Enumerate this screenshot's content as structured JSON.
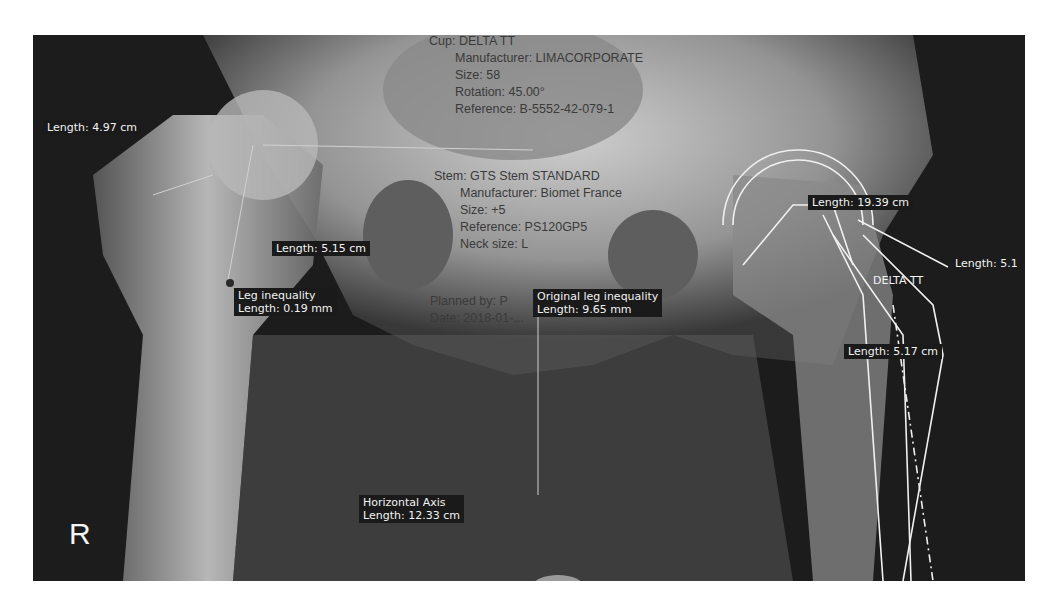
{
  "image": {
    "side_marker": "R"
  },
  "implants": {
    "cup": {
      "title": "Cup: DELTA TT",
      "manufacturer": "Manufacturer: LIMACORPORATE",
      "size": "Size: 58",
      "rotation": "Rotation: 45.00°",
      "reference": "Reference: B-5552-42-079-1"
    },
    "stem": {
      "title": "Stem: GTS Stem STANDARD",
      "manufacturer": "Manufacturer: Biomet France",
      "size": "Size: +5",
      "reference": "Reference: PS120GP5",
      "neck_size": "Neck size: L"
    },
    "planning": {
      "planned_by": "Planned by: P",
      "date": "Date: 2018-01-..."
    },
    "overlay_label": "DELTA TT"
  },
  "measurements": [
    {
      "id": "m1",
      "lines": [
        "Length: 4.97 cm"
      ]
    },
    {
      "id": "m2",
      "lines": [
        "Length: 5.15 cm"
      ]
    },
    {
      "id": "m3",
      "lines": [
        "Leg inequality",
        "Length: 0.19 mm"
      ]
    },
    {
      "id": "m4",
      "lines": [
        "Original leg inequality",
        "Length: 9.65 mm"
      ]
    },
    {
      "id": "m5",
      "lines": [
        "Length: 19.39 cm"
      ]
    },
    {
      "id": "m6",
      "lines": [
        "Length: 5.1"
      ]
    },
    {
      "id": "m7",
      "lines": [
        "Length: 5.17 cm"
      ]
    },
    {
      "id": "m8",
      "lines": [
        "Horizontal Axis",
        "Length: 12.33 cm"
      ]
    }
  ]
}
